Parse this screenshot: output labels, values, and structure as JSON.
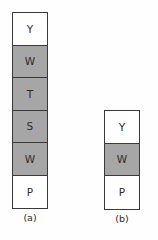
{
  "figure": {
    "background_color": "#fefefe",
    "border_color": "#3a3a3a",
    "shaded_color": "#a6a6a6",
    "unshaded_color": "#ffffff",
    "text_color": "#2b2b2b"
  },
  "stacks": [
    {
      "id": "a",
      "caption": "(a)",
      "left": 12,
      "top": 12,
      "width": 36,
      "cell_height": 32.5,
      "cells": [
        {
          "label": "Y",
          "shaded": false
        },
        {
          "label": "W",
          "shaded": true
        },
        {
          "label": "T",
          "shaded": true
        },
        {
          "label": "S",
          "shaded": true
        },
        {
          "label": "W",
          "shaded": true
        },
        {
          "label": "P",
          "shaded": false
        }
      ]
    },
    {
      "id": "b",
      "caption": "(b)",
      "left": 104,
      "top": 110,
      "width": 36,
      "cell_height": 32.5,
      "cells": [
        {
          "label": "Y",
          "shaded": false
        },
        {
          "label": "W",
          "shaded": true
        },
        {
          "label": "P",
          "shaded": false
        }
      ]
    }
  ]
}
